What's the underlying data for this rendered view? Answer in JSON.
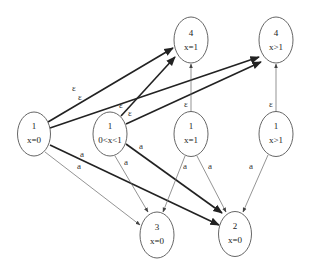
{
  "diagram": {
    "type": "automaton-graph",
    "nodes": [
      {
        "id": "n4x1",
        "line1": "4",
        "line2": "x=1",
        "cx": 191,
        "cy": 40
      },
      {
        "id": "n4xg1",
        "line1": "4",
        "line2": "x>1",
        "cx": 276,
        "cy": 40
      },
      {
        "id": "n1x0",
        "line1": "1",
        "line2": "x=0",
        "cx": 34,
        "cy": 134
      },
      {
        "id": "n1mid",
        "line1": "1",
        "line2": "0<x<1",
        "cx": 110,
        "cy": 134
      },
      {
        "id": "n1x1",
        "line1": "1",
        "line2": "x=1",
        "cx": 191,
        "cy": 134
      },
      {
        "id": "n1xg1",
        "line1": "1",
        "line2": "x>1",
        "cx": 276,
        "cy": 134
      },
      {
        "id": "n3x0",
        "line1": "3",
        "line2": "x=0",
        "cx": 157,
        "cy": 235
      },
      {
        "id": "n2x0",
        "line1": "2",
        "line2": "x=0",
        "cx": 235,
        "cy": 234
      }
    ],
    "edges": [
      {
        "from": "n1x0",
        "to": "n4x1",
        "label": "ε",
        "weight": "thick"
      },
      {
        "from": "n1x0",
        "to": "n4xg1",
        "label": "ε",
        "weight": "thick"
      },
      {
        "from": "n1mid",
        "to": "n4x1",
        "label": "ε",
        "weight": "thick"
      },
      {
        "from": "n1mid",
        "to": "n4xg1",
        "label": "ε",
        "weight": "thick"
      },
      {
        "from": "n1x1",
        "to": "n4x1",
        "label": "ε",
        "weight": "thin"
      },
      {
        "from": "n1xg1",
        "to": "n4xg1",
        "label": "ε",
        "weight": "thin"
      },
      {
        "from": "n1x0",
        "to": "n2x0",
        "label": "a",
        "weight": "thick"
      },
      {
        "from": "n1x0",
        "to": "n3x0",
        "label": "a",
        "weight": "thin"
      },
      {
        "from": "n1mid",
        "to": "n3x0",
        "label": "a",
        "weight": "thin"
      },
      {
        "from": "n1mid",
        "to": "n2x0",
        "label": "a",
        "weight": "thick"
      },
      {
        "from": "n1x1",
        "to": "n3x0",
        "label": "a",
        "weight": "thin"
      },
      {
        "from": "n1x1",
        "to": "n2x0",
        "label": "a",
        "weight": "thin"
      },
      {
        "from": "n1xg1",
        "to": "n2x0",
        "label": "a",
        "weight": "thin"
      }
    ],
    "edge_labels": {
      "eps": "ε",
      "a": "a"
    }
  }
}
